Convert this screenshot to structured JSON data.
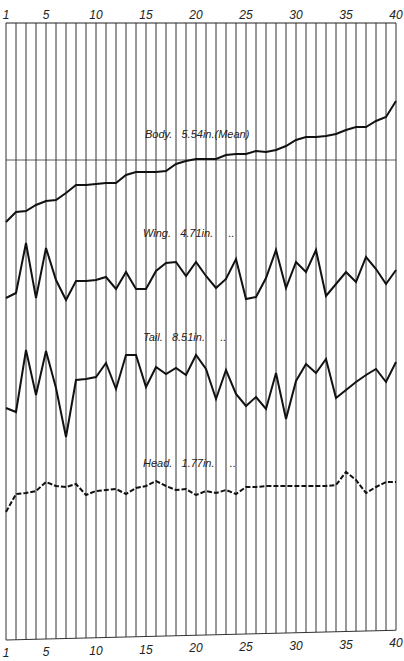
{
  "chart_data": {
    "type": "line",
    "title": "",
    "xlabel": "",
    "ylabel": "",
    "x": [
      1,
      2,
      3,
      4,
      5,
      6,
      7,
      8,
      9,
      10,
      11,
      12,
      13,
      14,
      15,
      16,
      17,
      18,
      19,
      20,
      21,
      22,
      23,
      24,
      25,
      26,
      27,
      28,
      29,
      30,
      31,
      32,
      33,
      34,
      35,
      36,
      37,
      38,
      39,
      40
    ],
    "x_tick_labels": [
      "1",
      "5",
      "10",
      "15",
      "20",
      "25",
      "30",
      "35",
      "40"
    ],
    "x_tick_positions": [
      1,
      5,
      10,
      15,
      20,
      25,
      30,
      35,
      40
    ],
    "grid": "vertical lines at every x (1-40)",
    "y_units_note": "Relative deviation plotted in pixel offsets from each series baseline; no numeric y-scale shown",
    "reference_line": {
      "series": "Body",
      "label": "mean",
      "y_px": 160
    },
    "series": [
      {
        "name": "Body",
        "label": "Body.   5.54in.(Mean)",
        "style": "solid",
        "y_px": [
          222,
          212,
          211,
          205,
          201,
          200,
          193,
          185,
          185,
          184,
          183,
          183,
          175,
          172,
          172,
          172,
          171,
          164,
          161,
          159,
          159,
          159,
          155,
          154,
          154,
          151,
          152,
          150,
          146,
          140,
          137,
          137,
          136,
          134,
          130,
          127,
          127,
          121,
          117,
          101
        ]
      },
      {
        "name": "Wing",
        "label": "Wing.   4.71in.     ..",
        "style": "solid",
        "y_px": [
          298,
          293,
          243,
          298,
          248,
          280,
          300,
          281,
          281,
          280,
          277,
          289,
          272,
          289,
          289,
          271,
          263,
          262,
          276,
          262,
          276,
          288,
          279,
          259,
          299,
          297,
          278,
          250,
          288,
          262,
          272,
          250,
          296,
          284,
          272,
          282,
          257,
          269,
          284,
          270
        ]
      },
      {
        "name": "Tail",
        "label": "Tail.   8.51in.     ..",
        "style": "solid",
        "y_px": [
          408,
          412,
          350,
          395,
          351,
          388,
          437,
          380,
          379,
          377,
          363,
          389,
          355,
          355,
          387,
          367,
          374,
          368,
          375,
          355,
          369,
          399,
          370,
          394,
          406,
          397,
          409,
          373,
          419,
          381,
          364,
          373,
          359,
          398,
          390,
          382,
          375,
          369,
          382,
          362,
          396,
          362
        ]
      },
      {
        "name": "Head",
        "label": "Head.   1.77in.     ..",
        "style": "mixed solid/dashed",
        "y_px": [
          512,
          494,
          493,
          491,
          482,
          486,
          487,
          484,
          495,
          491,
          490,
          489,
          494,
          488,
          486,
          481,
          486,
          490,
          489,
          495,
          491,
          493,
          490,
          494,
          487,
          487,
          486,
          486,
          486,
          486,
          486,
          486,
          486,
          485,
          472,
          480,
          493,
          487,
          482,
          482
        ]
      }
    ],
    "series_labels_position": {
      "Body": [
        145,
        138
      ],
      "Wing": [
        143,
        237
      ],
      "Tail": [
        143,
        341
      ],
      "Head": [
        143,
        467
      ]
    }
  }
}
